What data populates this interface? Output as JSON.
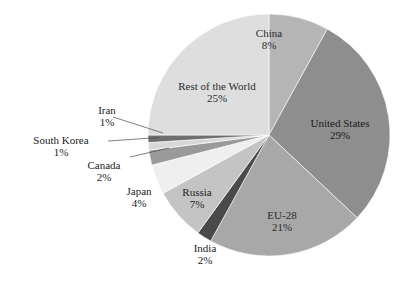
{
  "chart_data": {
    "type": "pie",
    "title": "",
    "subtitle": "",
    "xlabel": "",
    "ylabel": "",
    "legend_position": "none",
    "grid": false,
    "units": "percent",
    "start_angle_deg": 0,
    "direction": "clockwise",
    "categories": [
      "China",
      "United States",
      "EU-28",
      "India",
      "Russia",
      "Japan",
      "Canada",
      "South Korea",
      "Iran",
      "Rest of the World"
    ],
    "values": [
      8,
      29,
      21,
      2,
      7,
      4,
      2,
      1,
      1,
      25
    ],
    "slices": [
      {
        "name": "China",
        "value": 8,
        "pct_label": "8%",
        "color": "#b5b5b5",
        "label_placement": "inside"
      },
      {
        "name": "United States",
        "value": 29,
        "pct_label": "29%",
        "color": "#8e8e8e",
        "label_placement": "inside"
      },
      {
        "name": "EU-28",
        "value": 21,
        "pct_label": "21%",
        "color": "#a8a8a8",
        "label_placement": "inside"
      },
      {
        "name": "India",
        "value": 2,
        "pct_label": "2%",
        "color": "#4a4a4a",
        "label_placement": "outside"
      },
      {
        "name": "Russia",
        "value": 7,
        "pct_label": "7%",
        "color": "#c4c4c4",
        "label_placement": "outside"
      },
      {
        "name": "Japan",
        "value": 4,
        "pct_label": "4%",
        "color": "#efefef",
        "label_placement": "outside"
      },
      {
        "name": "Canada",
        "value": 2,
        "pct_label": "2%",
        "color": "#9a9a9a",
        "label_placement": "leader"
      },
      {
        "name": "South Korea",
        "value": 1,
        "pct_label": "1%",
        "color": "#d8d8d8",
        "label_placement": "leader"
      },
      {
        "name": "Iran",
        "value": 1,
        "pct_label": "1%",
        "color": "#6f6f6f",
        "label_placement": "leader"
      },
      {
        "name": "Rest of the World",
        "value": 25,
        "pct_label": "25%",
        "color": "#dedede",
        "label_placement": "inside"
      }
    ]
  },
  "labels": {
    "china": {
      "name": "China",
      "pct": "8%"
    },
    "united_states": {
      "name": "United States",
      "pct": "29%"
    },
    "eu28": {
      "name": "EU-28",
      "pct": "21%"
    },
    "india": {
      "name": "India",
      "pct": "2%"
    },
    "russia": {
      "name": "Russia",
      "pct": "7%"
    },
    "japan": {
      "name": "Japan",
      "pct": "4%"
    },
    "canada": {
      "name": "Canada",
      "pct": "2%"
    },
    "south_korea": {
      "name": "South Korea",
      "pct": "1%"
    },
    "iran": {
      "name": "Iran",
      "pct": "1%"
    },
    "rest_of_world": {
      "name": "Rest of the World",
      "pct": "25%"
    }
  },
  "geometry": {
    "center_x": 269,
    "center_y": 135,
    "radius": 121
  }
}
